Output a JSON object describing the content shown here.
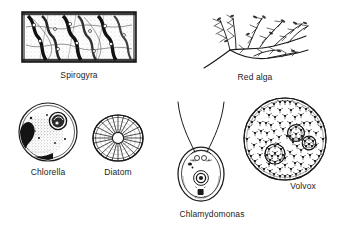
{
  "figure": {
    "background": "#ffffff",
    "ink_color": "#1b1b1b",
    "style": "black-and-white line drawing / stipple engraving"
  },
  "organisms": [
    {
      "id": "spirogyra",
      "label": "Spirogyra",
      "icon": "spirogyra-filament-icon",
      "shape": "rectangular filament cell chain with helical ribbon chloroplasts",
      "group": "green alga",
      "position": {
        "x": 18,
        "y": 7,
        "w": 122,
        "h": 60
      }
    },
    {
      "id": "red-alga",
      "label": "Red alga",
      "icon": "red-alga-thallus-icon",
      "shape": "branched feathery thallus",
      "group": "red alga",
      "position": {
        "x": 200,
        "y": 6,
        "w": 110,
        "h": 62
      }
    },
    {
      "id": "chlorella",
      "label": "Chlorella",
      "icon": "chlorella-cell-icon",
      "shape": "spherical cell with cup-shaped chloroplast, stippled cytoplasm and pyrenoid",
      "group": "green alga",
      "position": {
        "x": 17,
        "y": 101,
        "w": 62,
        "h": 62
      }
    },
    {
      "id": "diatom",
      "label": "Diatom",
      "icon": "diatom-frustule-icon",
      "shape": "radially striated disc frustule with central pore",
      "group": "diatom",
      "position": {
        "x": 90,
        "y": 112,
        "w": 56,
        "h": 52
      }
    },
    {
      "id": "chlamydomonas",
      "label": "Chlamydomonas",
      "icon": "chlamydomonas-cell-icon",
      "shape": "ovoid biflagellate cell with eyespot, pyrenoid and contractile vacuoles",
      "group": "green alga",
      "position": {
        "x": 166,
        "y": 96,
        "w": 70,
        "h": 108
      }
    },
    {
      "id": "volvox",
      "label": "Volvox",
      "icon": "volvox-colony-icon",
      "shape": "spherical colony of many flagellated cells with three daughter colonies",
      "group": "green alga",
      "daughter_colonies": 3,
      "position": {
        "x": 240,
        "y": 96,
        "w": 92,
        "h": 86
      }
    }
  ]
}
